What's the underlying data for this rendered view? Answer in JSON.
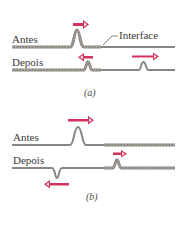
{
  "panel_a": {
    "before_label": "Antes",
    "after_label": "Depois",
    "interface_label": "Interface",
    "caption": "(a)"
  },
  "panel_b": {
    "before_label": "Antes",
    "after_label": "Depois",
    "caption": "(b)"
  },
  "colors": {
    "rope": "#8a8580",
    "rope_dark": "#5e5a55",
    "arrow": "#d2335c",
    "text": "#3a3a3a"
  }
}
